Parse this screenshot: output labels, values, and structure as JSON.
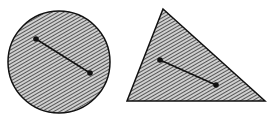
{
  "figure": {
    "colors": {
      "background": "#ffffff",
      "stroke": "#111111",
      "hatch_line": "#555555",
      "hatch_bg": "#cfcfcf"
    },
    "shapes": [
      {
        "type": "circle",
        "cx": 59,
        "cy": 62,
        "r": 51,
        "segment": {
          "p1": [
            36,
            39
          ],
          "p2": [
            90,
            73
          ]
        }
      },
      {
        "type": "triangle",
        "vertices": [
          [
            163,
            9
          ],
          [
            127,
            101
          ],
          [
            265,
            101
          ]
        ],
        "segment": {
          "p1": [
            160,
            60
          ],
          "p2": [
            216,
            85
          ]
        }
      }
    ]
  }
}
